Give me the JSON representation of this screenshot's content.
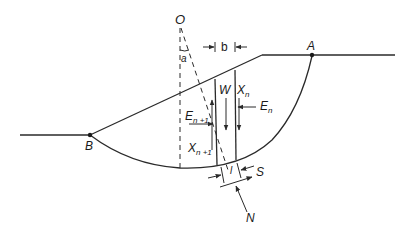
{
  "figure": {
    "labels": {
      "center": "O",
      "angle": "a",
      "point_a": "A",
      "point_b": "B",
      "slice_width": "b",
      "weight": "W",
      "x_n_main": "X",
      "x_n_sub": "n",
      "e_n_main": "E",
      "e_n_sub": "n",
      "e_n1_main": "E",
      "e_n1_sub": "n +1",
      "x_n1_main": "X",
      "x_n1_sub": "n +1",
      "base_length": "l",
      "shear": "S",
      "normal": "N"
    },
    "colors": {
      "line": "#2a2a2a",
      "background": "#ffffff"
    }
  }
}
